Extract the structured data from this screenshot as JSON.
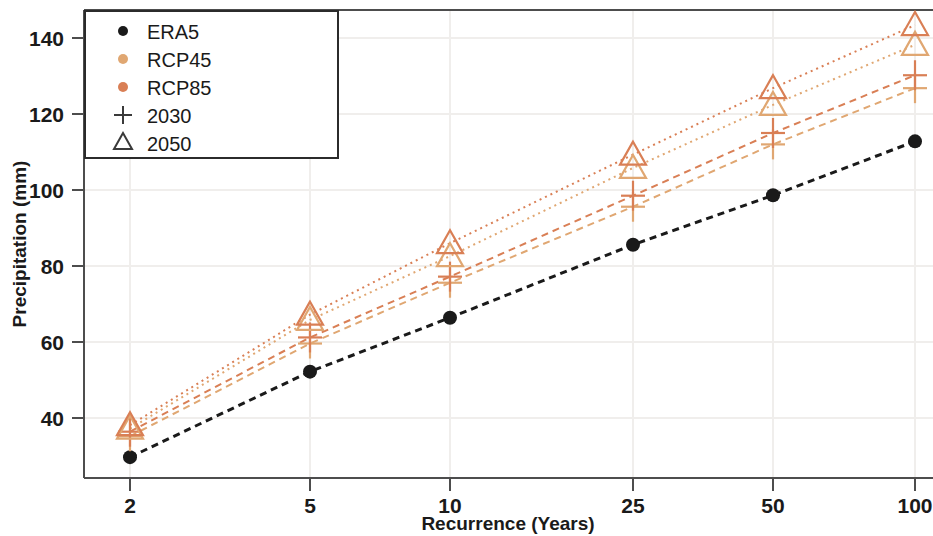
{
  "chart_data": {
    "type": "line",
    "title": "",
    "xlabel": "Recurrence (Years)",
    "ylabel": "Precipitation (mm)",
    "x": [
      2,
      5,
      10,
      25,
      50,
      100
    ],
    "xtick_labels": [
      "2",
      "5",
      "10",
      "25",
      "50",
      "100"
    ],
    "ytick_labels": [
      "40",
      "60",
      "80",
      "100",
      "120",
      "140"
    ],
    "yticks": [
      40,
      60,
      80,
      100,
      120,
      140
    ],
    "ylim": [
      27,
      147
    ],
    "grid": true,
    "legend_position": "top-left",
    "series": [
      {
        "name": "ERA5",
        "marker": "circle",
        "color": "#1a1a1a",
        "linestyle": "dashed",
        "values": [
          29.7,
          52.2,
          66.4,
          85.6,
          98.6,
          112.8
        ]
      },
      {
        "name": "RCP45 2030",
        "scenario": "RCP45",
        "horizon": "2030",
        "marker": "plus",
        "color": "#e0a772",
        "linestyle": "dashed",
        "values": [
          35.2,
          59.6,
          75.6,
          95.6,
          112.0,
          126.8
        ]
      },
      {
        "name": "RCP85 2030",
        "scenario": "RCP85",
        "horizon": "2030",
        "marker": "plus",
        "color": "#d97f55",
        "linestyle": "dashed",
        "values": [
          36.4,
          61.2,
          77.2,
          98.5,
          115.0,
          130.2
        ]
      },
      {
        "name": "RCP45 2050",
        "scenario": "RCP45",
        "horizon": "2050",
        "marker": "triangle",
        "color": "#e0a772",
        "linestyle": "dotted",
        "values": [
          37.2,
          65.8,
          82.6,
          105.8,
          122.4,
          138.2
        ]
      },
      {
        "name": "RCP85 2050",
        "scenario": "RCP85",
        "horizon": "2050",
        "marker": "triangle",
        "color": "#d97f55",
        "linestyle": "dotted",
        "values": [
          38.1,
          67.2,
          86.0,
          109.3,
          126.8,
          143.4
        ]
      }
    ]
  },
  "legend": {
    "entries": [
      {
        "label": "ERA5",
        "marker": "circle",
        "color": "#1a1a1a"
      },
      {
        "label": "RCP45",
        "marker": "circle",
        "color": "#e0a772"
      },
      {
        "label": "RCP85",
        "marker": "circle",
        "color": "#d97f55"
      },
      {
        "label": "2030",
        "marker": "plus",
        "color": "#3a3a3a"
      },
      {
        "label": "2050",
        "marker": "triangle",
        "color": "#3a3a3a"
      }
    ]
  },
  "colors": {
    "era5": "#1a1a1a",
    "rcp45": "#e0a772",
    "rcp85": "#d97f55",
    "axis": "#4d4d4d",
    "grid": "#f0eeec",
    "background": "#ffffff"
  }
}
